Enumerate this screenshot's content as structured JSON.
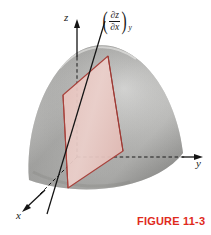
{
  "figure": {
    "caption": "FIGURE 11-3",
    "caption_color": "#e02a1c",
    "axes": {
      "z_label": "z",
      "y_label": "y",
      "x_label": "x"
    },
    "annotation": {
      "open_paren": "(",
      "close_paren": ")",
      "numerator": "∂z",
      "denominator": "∂x",
      "subscript": "y",
      "plain": "(∂z/∂x)y"
    },
    "colors": {
      "surface_light": "#dcdcda",
      "surface_mid": "#b4b4b2",
      "surface_dark": "#8e8e8c",
      "plane_fill": "#e9c8c3",
      "plane_stroke": "#a8423c",
      "axis_line": "#141414",
      "caption_red": "#e02a1c"
    },
    "elements": {
      "surface_name": "z = f(x, y) surface",
      "plane_name": "constant-y slice plane",
      "tangent_line_name": "tangent line of slope (∂z/∂x)y"
    }
  }
}
